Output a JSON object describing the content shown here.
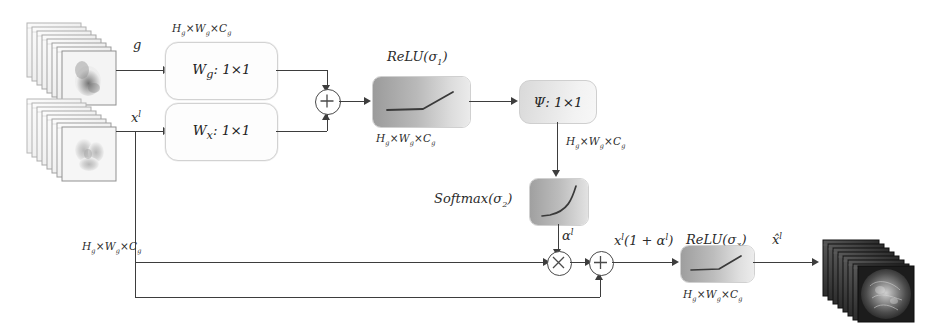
{
  "diagram": {
    "arrow_labels": {
      "gate_signal": "g",
      "skip_signal": "x",
      "skip_signal_sup": "l",
      "alpha": "α",
      "alpha_sup": "l",
      "weighted": "x",
      "weighted_sup": "l",
      "weighted_rest": "(1 + α",
      "weighted_rest2": ")",
      "output": "x̂",
      "output_sup": "l"
    },
    "conv_blocks": [
      {
        "name": "wg",
        "label_main": "W",
        "label_sub": "g",
        "label_rest": ": 1×1"
      },
      {
        "name": "wx",
        "label_main": "W",
        "label_sub": "x",
        "label_rest": ": 1×1"
      }
    ],
    "psi_block": {
      "label_main": "Ψ",
      "label_rest": ": 1×1"
    },
    "activations": [
      {
        "name": "relu1",
        "label_main": "ReLU",
        "label_arg": "(σ",
        "label_sub": "1",
        "label_close": ")",
        "curve": "relu"
      },
      {
        "name": "softmax",
        "label_main": "Softmax",
        "label_arg": "(σ",
        "label_sub": "2",
        "label_close": ")",
        "curve": "softmax"
      },
      {
        "name": "relu3",
        "label_main": "ReLU",
        "label_arg": "(σ",
        "label_sub": "3",
        "label_close": ")",
        "curve": "relu"
      }
    ],
    "dimension_labels": [
      {
        "name": "dim-top",
        "h": "H",
        "hs": "g",
        "w": "W",
        "ws": "g",
        "c": "C",
        "cs": "g"
      },
      {
        "name": "dim-relu1",
        "h": "H",
        "hs": "g",
        "w": "W",
        "ws": "g",
        "c": "C",
        "cs": "g"
      },
      {
        "name": "dim-psi",
        "h": "H",
        "hs": "g",
        "w": "W",
        "ws": "g",
        "c": "C",
        "cs": "g"
      },
      {
        "name": "dim-skip",
        "h": "H",
        "hs": "g",
        "w": "W",
        "ws": "g",
        "c": "C",
        "cs": "g"
      },
      {
        "name": "dim-relu3",
        "h": "H",
        "hs": "g",
        "w": "W",
        "ws": "g",
        "c": "C",
        "cs": "g"
      }
    ],
    "operators": [
      {
        "name": "add-top",
        "symbol": "plus"
      },
      {
        "name": "multiply",
        "symbol": "times"
      },
      {
        "name": "add-bottom",
        "symbol": "plus"
      }
    ],
    "feature_stacks": [
      {
        "name": "input-stack-g",
        "tone": "light",
        "sheets": 9
      },
      {
        "name": "input-stack-x",
        "tone": "light",
        "sheets": 9
      },
      {
        "name": "output-stack",
        "tone": "dark",
        "sheets": 10
      }
    ],
    "colors": {
      "line": "#3d3d3d",
      "box_border": "#d2d2d2",
      "shade_dark": "#9a9a9a",
      "shade_light": "#efefef",
      "background": "#ffffff"
    }
  }
}
